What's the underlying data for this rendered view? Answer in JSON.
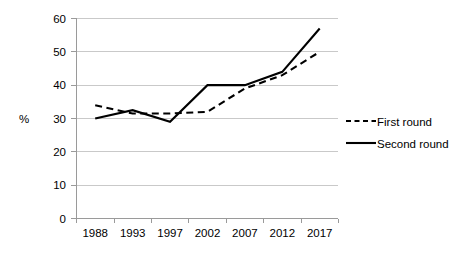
{
  "chart_data": {
    "type": "line",
    "title": "",
    "xlabel": "",
    "ylabel": "%",
    "categories": [
      "1988",
      "1993",
      "1997",
      "2002",
      "2007",
      "2012",
      "2017"
    ],
    "x": [
      1988,
      1993,
      1997,
      2002,
      2007,
      2012,
      2017
    ],
    "series": [
      {
        "name": "First round",
        "style": "dashed",
        "color": "#000000",
        "values": [
          34,
          31.5,
          31.5,
          32,
          39,
          43,
          50
        ]
      },
      {
        "name": "Second round",
        "style": "solid",
        "color": "#000000",
        "values": [
          30,
          32.5,
          29,
          40,
          40,
          44,
          57
        ]
      }
    ],
    "ylim": [
      0,
      60
    ],
    "yticks": [
      0,
      10,
      20,
      30,
      40,
      50,
      60
    ],
    "ytick_labels": [
      "0",
      "10",
      "20",
      "30",
      "40",
      "50",
      "60"
    ],
    "grid": true,
    "grid_axis": "y",
    "legend_position": "right"
  },
  "axes": {
    "y_title": "%",
    "y_tick_labels": [
      "60",
      "50",
      "40",
      "30",
      "20",
      "10",
      "0"
    ],
    "x_tick_labels": [
      "1988",
      "1993",
      "1997",
      "2002",
      "2007",
      "2012",
      "2017"
    ]
  },
  "legend": {
    "items": [
      {
        "label": "First round",
        "style": "dashed"
      },
      {
        "label": "Second round",
        "style": "solid"
      }
    ]
  },
  "colors": {
    "series": "#000000",
    "gridline": "#c9c9c9",
    "axis": "#9a9a9a",
    "background": "#ffffff"
  }
}
